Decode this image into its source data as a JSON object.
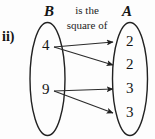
{
  "figure": {
    "enumeration_label": "ii)",
    "relation_caption": {
      "line1": "is the",
      "line2": "square of"
    },
    "colors": {
      "ink": "#141414",
      "background": "#fdfdfd",
      "arrow": "#2b2b2b"
    },
    "sets": [
      {
        "id": "set-b",
        "name": "B",
        "side": "left",
        "elements": [
          {
            "value": "4"
          },
          {
            "value": "9"
          }
        ]
      },
      {
        "id": "set-a",
        "name": "A",
        "side": "right",
        "elements": [
          {
            "value": "2"
          },
          {
            "value": "2"
          },
          {
            "value": "3"
          },
          {
            "value": "3"
          }
        ]
      }
    ],
    "mappings": [
      {
        "from": "4",
        "to": "2",
        "from_index": 0,
        "to_index": 0
      },
      {
        "from": "4",
        "to": "2",
        "from_index": 0,
        "to_index": 1
      },
      {
        "from": "9",
        "to": "3",
        "from_index": 1,
        "to_index": 2
      },
      {
        "from": "9",
        "to": "3",
        "from_index": 1,
        "to_index": 3
      }
    ]
  }
}
